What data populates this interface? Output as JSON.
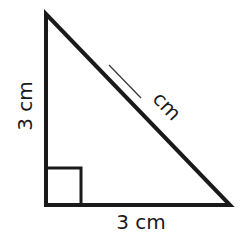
{
  "diagram": {
    "type": "right-triangle",
    "stroke_color": "#1a1a1a",
    "background": "#ffffff",
    "vertices": {
      "top": [
        46,
        14
      ],
      "bottom_left": [
        46,
        205
      ],
      "bottom_right": [
        230,
        205
      ]
    },
    "right_angle_marker": {
      "corner": "bottom_left",
      "size": 36
    },
    "labels": {
      "left_side": "3 cm",
      "bottom_side": "3 cm",
      "hypotenuse_unit": "cm"
    },
    "hypotenuse_answer_blank": ""
  }
}
